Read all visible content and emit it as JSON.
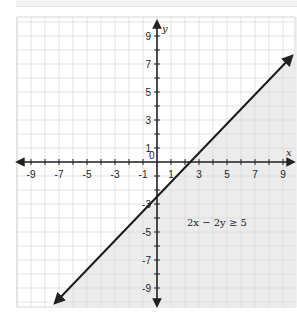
{
  "chart_data": {
    "type": "line",
    "title": "",
    "xlabel": "x",
    "ylabel": "y",
    "xlim": [
      -10,
      10
    ],
    "ylim": [
      -10,
      10
    ],
    "grid": true,
    "x_ticks": [
      -9,
      -7,
      -5,
      -3,
      -1,
      1,
      3,
      5,
      7,
      9
    ],
    "y_ticks": [
      -9,
      -7,
      -5,
      -3,
      -1,
      1,
      3,
      5,
      7,
      9
    ],
    "origin_label": "0",
    "series": [
      {
        "name": "boundary 2x - 2y = 5",
        "equation": "y = x - 2.5",
        "style": "solid",
        "points": [
          [
            -7.5,
            -10
          ],
          [
            9.8,
            7.3
          ]
        ]
      }
    ],
    "shaded_region": "below-right of line (2x - 2y >= 5)",
    "annotations": [
      {
        "text": "2x − 2y ≥ 5",
        "x": 4,
        "y": -4
      }
    ],
    "colors": {
      "shade": "#ececec",
      "grid": "#d9d9d9",
      "axis": "#222222",
      "line": "#1a1a1a"
    }
  },
  "labels": {
    "x_axis": "x",
    "y_axis": "y",
    "origin": "0",
    "inequality": "2x − 2y ≥ 5",
    "x_ticks": [
      "-9",
      "-7",
      "-5",
      "-3",
      "-1",
      "1",
      "3",
      "5",
      "7",
      "9"
    ],
    "y_ticks": [
      "9",
      "7",
      "5",
      "3",
      "1",
      "-1",
      "-3",
      "-5",
      "-7",
      "-9"
    ]
  }
}
